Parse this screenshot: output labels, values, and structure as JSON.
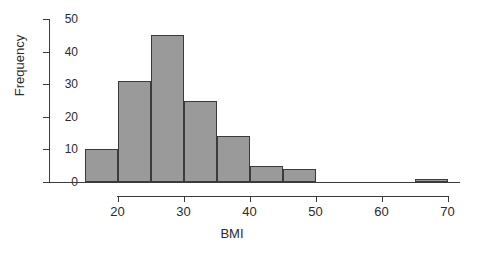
{
  "chart_data": {
    "type": "bar",
    "title": "",
    "subtitle": "",
    "xlabel": "BMI",
    "ylabel": "Frequency",
    "xlim": [
      15,
      70
    ],
    "ylim": [
      0,
      50
    ],
    "grid": false,
    "legend": null,
    "bin_width": 5,
    "bin_edges": [
      15,
      20,
      25,
      30,
      35,
      40,
      45,
      50,
      55,
      60,
      65,
      70
    ],
    "categories": [
      "15-20",
      "20-25",
      "25-30",
      "30-35",
      "35-40",
      "40-45",
      "45-50",
      "50-55",
      "55-60",
      "60-65",
      "65-70"
    ],
    "values": [
      10,
      31,
      45,
      25,
      14,
      5,
      4,
      0,
      0,
      0,
      1
    ],
    "xticks": [
      20,
      30,
      40,
      50,
      60,
      70
    ],
    "xtick_labels": [
      "20",
      "30",
      "40",
      "50",
      "60",
      "70"
    ],
    "yticks": [
      0,
      10,
      20,
      30,
      40,
      50
    ],
    "ytick_labels": [
      "0",
      "10",
      "20",
      "30",
      "40",
      "50"
    ],
    "bar_fill_color": "#9a9a9a",
    "bar_edge_color": "#3b3b3b",
    "axis_color": "#3b3b3b",
    "background_color": "#ffffff"
  }
}
